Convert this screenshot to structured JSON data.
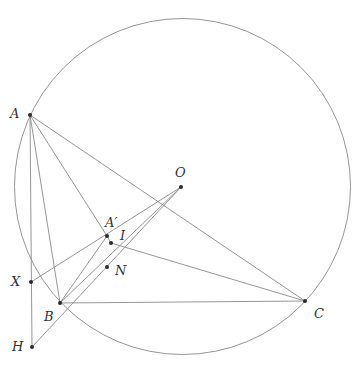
{
  "diagram": {
    "circle": {
      "cx": 182.5,
      "cy": 186.5,
      "r": 168
    },
    "points": [
      {
        "name": "A",
        "label": "A",
        "x": 30,
        "y": 115,
        "lx": 10,
        "ly": 118
      },
      {
        "name": "O",
        "label": "O",
        "x": 181,
        "y": 187,
        "lx": 175,
        "ly": 177
      },
      {
        "name": "A-prime",
        "label": "A′",
        "x": 107,
        "y": 236,
        "lx": 105,
        "ly": 227
      },
      {
        "name": "I",
        "label": "I",
        "x": 111,
        "y": 243,
        "lx": 120,
        "ly": 240
      },
      {
        "name": "N",
        "label": "N",
        "x": 107,
        "y": 267,
        "lx": 115,
        "ly": 275
      },
      {
        "name": "X",
        "label": "X",
        "x": 31,
        "y": 282,
        "lx": 11,
        "ly": 286
      },
      {
        "name": "B",
        "label": "B",
        "x": 60,
        "y": 303,
        "lx": 44,
        "ly": 321
      },
      {
        "name": "C",
        "label": "C",
        "x": 305,
        "y": 301,
        "lx": 314,
        "ly": 318
      },
      {
        "name": "H",
        "label": "H",
        "x": 32,
        "y": 347,
        "lx": 12,
        "ly": 351
      }
    ],
    "segments": [
      [
        "A",
        "H"
      ],
      [
        "A",
        "B"
      ],
      [
        "A",
        "C"
      ],
      [
        "A",
        "A-prime"
      ],
      [
        "A-prime",
        "I"
      ],
      [
        "I",
        "C"
      ],
      [
        "B",
        "C"
      ],
      [
        "B",
        "A-prime"
      ],
      [
        "X",
        "O"
      ],
      [
        "H",
        "O"
      ],
      [
        "B",
        "O"
      ]
    ]
  }
}
